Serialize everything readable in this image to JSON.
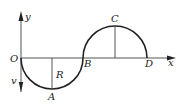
{
  "diagram": {
    "type": "track-path",
    "axes": {
      "x_label": "x",
      "y_label": "y",
      "origin_label": "O"
    },
    "points": {
      "O": "O",
      "A": "A",
      "B": "B",
      "C": "C",
      "D": "D"
    },
    "radius_label": "R",
    "velocity_label": "v",
    "colors": {
      "stroke": "#222222",
      "axis": "#555555",
      "background": "#ffffff"
    }
  }
}
